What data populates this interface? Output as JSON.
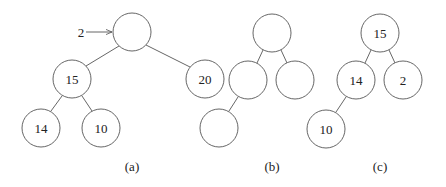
{
  "figure": {
    "diagrams": [
      {
        "caption": "(a)",
        "insert_label": "2",
        "nodes": [
          {
            "id": "a0",
            "x": 132,
            "y": 32,
            "value": ""
          },
          {
            "id": "a1",
            "x": 72,
            "y": 79,
            "value": "15"
          },
          {
            "id": "a2",
            "x": 205,
            "y": 79,
            "value": "20"
          },
          {
            "id": "a3",
            "x": 41,
            "y": 128,
            "value": "14"
          },
          {
            "id": "a4",
            "x": 101,
            "y": 128,
            "value": "10"
          }
        ],
        "edges": [
          [
            "a0",
            "a1"
          ],
          [
            "a0",
            "a2"
          ],
          [
            "a1",
            "a3"
          ],
          [
            "a1",
            "a4"
          ]
        ]
      },
      {
        "caption": "(b)",
        "nodes": [
          {
            "id": "b0",
            "x": 272,
            "y": 33,
            "value": ""
          },
          {
            "id": "b1",
            "x": 248,
            "y": 80,
            "value": ""
          },
          {
            "id": "b2",
            "x": 295,
            "y": 80,
            "value": ""
          },
          {
            "id": "b3",
            "x": 219,
            "y": 128,
            "value": ""
          }
        ],
        "edges": [
          [
            "b0",
            "b1"
          ],
          [
            "b0",
            "b2"
          ],
          [
            "b1",
            "b3"
          ]
        ]
      },
      {
        "caption": "(c)",
        "nodes": [
          {
            "id": "c0",
            "x": 380,
            "y": 33,
            "value": "15"
          },
          {
            "id": "c1",
            "x": 356,
            "y": 80,
            "value": "14"
          },
          {
            "id": "c2",
            "x": 403,
            "y": 80,
            "value": "2"
          },
          {
            "id": "c3",
            "x": 326,
            "y": 129,
            "value": "10"
          }
        ],
        "edges": [
          [
            "c0",
            "c1"
          ],
          [
            "c0",
            "c2"
          ],
          [
            "c1",
            "c3"
          ]
        ]
      }
    ]
  }
}
